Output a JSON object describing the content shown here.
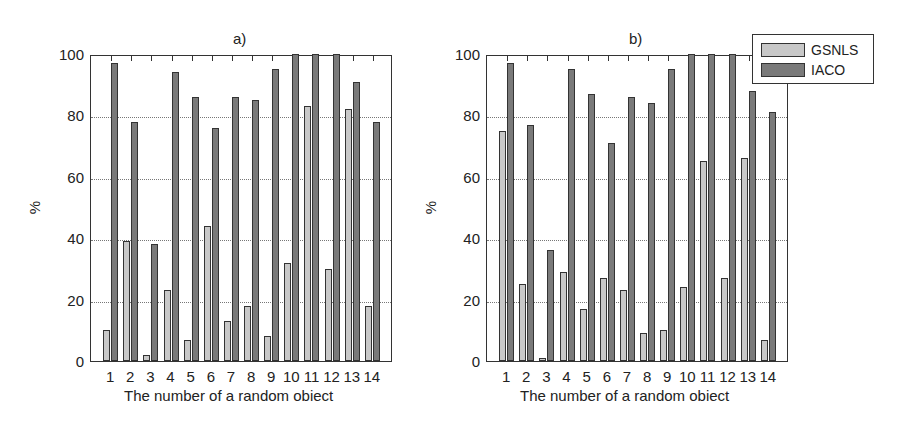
{
  "chart_data": [
    {
      "type": "bar",
      "title": "a)",
      "xlabel": "The number of a random obiect",
      "ylabel": "%",
      "ylim": [
        0,
        100
      ],
      "yticks": [
        0,
        20,
        40,
        60,
        80,
        100
      ],
      "grid": "y dotted",
      "categories": [
        "1",
        "2",
        "3",
        "4",
        "5",
        "6",
        "7",
        "8",
        "9",
        "10",
        "11",
        "12",
        "13",
        "14"
      ],
      "series": [
        {
          "name": "GSNLS",
          "color": "#c8c8c8",
          "values": [
            10,
            39,
            2,
            23,
            7,
            44,
            13,
            18,
            8,
            32,
            83,
            30,
            82,
            18
          ]
        },
        {
          "name": "IACO",
          "color": "#7a7a7a",
          "values": [
            97,
            78,
            38,
            94,
            86,
            76,
            86,
            85,
            95,
            100,
            100,
            100,
            91,
            78
          ]
        }
      ]
    },
    {
      "type": "bar",
      "title": "b)",
      "xlabel": "The number of a random obiect",
      "ylabel": "%",
      "ylim": [
        0,
        100
      ],
      "yticks": [
        0,
        20,
        40,
        60,
        80,
        100
      ],
      "grid": "y dotted",
      "legend_position": "top-right",
      "categories": [
        "1",
        "2",
        "3",
        "4",
        "5",
        "6",
        "7",
        "8",
        "9",
        "10",
        "11",
        "12",
        "13",
        "14"
      ],
      "series": [
        {
          "name": "GSNLS",
          "color": "#c8c8c8",
          "values": [
            75,
            25,
            1,
            29,
            17,
            27,
            23,
            9,
            10,
            24,
            65,
            27,
            66,
            7
          ]
        },
        {
          "name": "IACO",
          "color": "#7a7a7a",
          "values": [
            97,
            77,
            36,
            95,
            87,
            71,
            86,
            84,
            95,
            100,
            100,
            100,
            88,
            81
          ]
        }
      ]
    }
  ],
  "legend": {
    "items": [
      {
        "label": "GSNLS",
        "color": "#c8c8c8"
      },
      {
        "label": "IACO",
        "color": "#7a7a7a"
      }
    ]
  }
}
